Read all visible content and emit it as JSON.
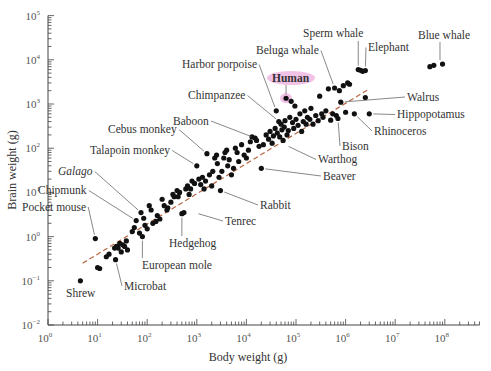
{
  "chart_data": {
    "type": "scatter",
    "title": "",
    "xlabel": "Body weight (g)",
    "ylabel": "Brain weight (g)",
    "xscale": "log",
    "yscale": "log",
    "xlim": [
      1,
      500000000
    ],
    "ylim": [
      0.01,
      100000
    ],
    "x_ticks": [
      {
        "base": "10",
        "exp": "0"
      },
      {
        "base": "10",
        "exp": "1"
      },
      {
        "base": "10",
        "exp": "2"
      },
      {
        "base": "10",
        "exp": "3"
      },
      {
        "base": "10",
        "exp": "4"
      },
      {
        "base": "10",
        "exp": "5"
      },
      {
        "base": "10",
        "exp": "6"
      },
      {
        "base": "10",
        "exp": "7"
      },
      {
        "base": "10",
        "exp": "8"
      }
    ],
    "y_ticks": [
      {
        "base": "10",
        "exp": "−2"
      },
      {
        "base": "10",
        "exp": "−1"
      },
      {
        "base": "10",
        "exp": "0"
      },
      {
        "base": "10",
        "exp": "1"
      },
      {
        "base": "10",
        "exp": "2"
      },
      {
        "base": "10",
        "exp": "3"
      },
      {
        "base": "10",
        "exp": "4"
      },
      {
        "base": "10",
        "exp": "5"
      }
    ],
    "grid": false,
    "legend": null,
    "trendline": {
      "style": "dashed",
      "color": "#b5653f",
      "from": [
        5,
        0.25
      ],
      "to": [
        3000000,
        2200
      ]
    },
    "highlight_color": "#e68fd0",
    "point_color": "#111111",
    "labeled_points": [
      {
        "label": "Shrew",
        "x": 4.5,
        "y": 0.1,
        "lx": 66,
        "ly": 297
      },
      {
        "label": "Microbat",
        "x": 23,
        "y": 0.3,
        "lx": 124,
        "ly": 290
      },
      {
        "label": "Pocket mouse",
        "x": 9,
        "y": 0.9,
        "lx": 22,
        "ly": 211
      },
      {
        "label": "Chipmunk",
        "x": 60,
        "y": 2.3,
        "lx": 38,
        "ly": 194
      },
      {
        "label": "Galago",
        "x": 75,
        "y": 3.5,
        "lx": 58,
        "ly": 175,
        "italic": true
      },
      {
        "label": "European mole",
        "x": 80,
        "y": 1.0,
        "lx": 142,
        "ly": 269
      },
      {
        "label": "Hedgehog",
        "x": 500,
        "y": 3.3,
        "lx": 169,
        "ly": 247
      },
      {
        "label": "Tenrec",
        "x": 900,
        "y": 3.5,
        "lx": 225,
        "ly": 225
      },
      {
        "label": "Rabbit",
        "x": 3000,
        "y": 11,
        "lx": 260,
        "ly": 209
      },
      {
        "label": "Talapoin monkey",
        "x": 1000,
        "y": 40,
        "lx": 90,
        "ly": 154
      },
      {
        "label": "Cebus monkey",
        "x": 1600,
        "y": 75,
        "lx": 108,
        "ly": 133
      },
      {
        "label": "Baboon",
        "x": 15000,
        "y": 170,
        "lx": 173,
        "ly": 125
      },
      {
        "label": "Beaver",
        "x": 20000,
        "y": 35,
        "lx": 323,
        "ly": 180
      },
      {
        "label": "Warthog",
        "x": 60000,
        "y": 120,
        "lx": 318,
        "ly": 163
      },
      {
        "label": "Chimpanzee",
        "x": 46000,
        "y": 400,
        "lx": 188,
        "ly": 99
      },
      {
        "label": "Harbor porpoise",
        "x": 40000,
        "y": 700,
        "lx": 182,
        "ly": 68
      },
      {
        "label": "Human",
        "x": 63000,
        "y": 1350,
        "lx": 272,
        "ly": 82,
        "highlight": true
      },
      {
        "label": "Beluga whale",
        "x": 600000,
        "y": 2300,
        "lx": 256,
        "ly": 54
      },
      {
        "label": "Sperm whale",
        "x": 1800000,
        "y": 6000,
        "lx": 303,
        "ly": 37
      },
      {
        "label": "Elephant",
        "x": 2500000,
        "y": 5700,
        "lx": 368,
        "ly": 51
      },
      {
        "label": "Blue whale",
        "x": 80000000,
        "y": 8000,
        "lx": 418,
        "ly": 39
      },
      {
        "label": "Walrus",
        "x": 800000,
        "y": 1100,
        "lx": 407,
        "ly": 101
      },
      {
        "label": "Hippopotamus",
        "x": 3000000,
        "y": 600,
        "lx": 397,
        "ly": 118
      },
      {
        "label": "Rhinoceros",
        "x": 1500000,
        "y": 600,
        "lx": 374,
        "ly": 135
      },
      {
        "label": "Bison",
        "x": 700000,
        "y": 470,
        "lx": 342,
        "ly": 150
      }
    ],
    "points": [
      [
        4.5,
        0.1
      ],
      [
        9,
        0.9
      ],
      [
        10,
        0.2
      ],
      [
        11,
        0.19
      ],
      [
        15,
        0.35
      ],
      [
        17,
        0.4
      ],
      [
        22,
        0.55
      ],
      [
        23,
        0.3
      ],
      [
        24,
        0.6
      ],
      [
        26,
        0.55
      ],
      [
        28,
        0.7
      ],
      [
        30,
        0.45
      ],
      [
        32,
        0.65
      ],
      [
        35,
        0.6
      ],
      [
        38,
        0.8
      ],
      [
        40,
        0.5
      ],
      [
        50,
        1.3
      ],
      [
        55,
        1.6
      ],
      [
        60,
        2.3
      ],
      [
        70,
        1.2
      ],
      [
        75,
        3.5
      ],
      [
        80,
        1.0
      ],
      [
        85,
        2.6
      ],
      [
        90,
        1.8
      ],
      [
        100,
        1.5
      ],
      [
        110,
        5
      ],
      [
        120,
        4
      ],
      [
        130,
        2
      ],
      [
        150,
        2.2
      ],
      [
        160,
        3
      ],
      [
        180,
        2.5
      ],
      [
        200,
        7
      ],
      [
        220,
        5
      ],
      [
        250,
        4
      ],
      [
        260,
        4.5
      ],
      [
        300,
        6
      ],
      [
        330,
        9
      ],
      [
        350,
        8
      ],
      [
        400,
        11
      ],
      [
        420,
        8
      ],
      [
        450,
        10
      ],
      [
        500,
        3.3
      ],
      [
        550,
        3.5
      ],
      [
        600,
        12
      ],
      [
        650,
        14
      ],
      [
        700,
        9
      ],
      [
        750,
        12
      ],
      [
        800,
        18
      ],
      [
        900,
        16
      ],
      [
        1000,
        40
      ],
      [
        1100,
        20
      ],
      [
        1200,
        15
      ],
      [
        1300,
        22
      ],
      [
        1400,
        12
      ],
      [
        1500,
        18
      ],
      [
        1600,
        75
      ],
      [
        1800,
        25
      ],
      [
        2000,
        14
      ],
      [
        2100,
        30
      ],
      [
        2300,
        60
      ],
      [
        2500,
        70
      ],
      [
        2600,
        45
      ],
      [
        2800,
        22
      ],
      [
        3000,
        11
      ],
      [
        3200,
        30
      ],
      [
        3500,
        60
      ],
      [
        3700,
        80
      ],
      [
        4000,
        90
      ],
      [
        4200,
        40
      ],
      [
        4500,
        55
      ],
      [
        5000,
        25
      ],
      [
        5500,
        35
      ],
      [
        6000,
        100
      ],
      [
        6500,
        80
      ],
      [
        7000,
        50
      ],
      [
        8000,
        120
      ],
      [
        9000,
        70
      ],
      [
        10000,
        60
      ],
      [
        11000,
        90
      ],
      [
        12000,
        140
      ],
      [
        13000,
        180
      ],
      [
        15000,
        170
      ],
      [
        16000,
        150
      ],
      [
        18000,
        110
      ],
      [
        20000,
        35
      ],
      [
        22000,
        120
      ],
      [
        25000,
        200
      ],
      [
        28000,
        160
      ],
      [
        30000,
        240
      ],
      [
        33000,
        130
      ],
      [
        35000,
        190
      ],
      [
        38000,
        280
      ],
      [
        40000,
        700
      ],
      [
        42000,
        220
      ],
      [
        45000,
        400
      ],
      [
        47000,
        180
      ],
      [
        50000,
        350
      ],
      [
        52000,
        260
      ],
      [
        55000,
        150
      ],
      [
        58000,
        300
      ],
      [
        60000,
        420
      ],
      [
        63000,
        1350
      ],
      [
        66000,
        200
      ],
      [
        70000,
        250
      ],
      [
        75000,
        500
      ],
      [
        80000,
        1150
      ],
      [
        85000,
        380
      ],
      [
        90000,
        280
      ],
      [
        95000,
        900
      ],
      [
        100000,
        450
      ],
      [
        110000,
        330
      ],
      [
        120000,
        600
      ],
      [
        130000,
        240
      ],
      [
        140000,
        400
      ],
      [
        150000,
        700
      ],
      [
        160000,
        350
      ],
      [
        170000,
        500
      ],
      [
        190000,
        450
      ],
      [
        200000,
        800
      ],
      [
        220000,
        350
      ],
      [
        250000,
        550
      ],
      [
        280000,
        420
      ],
      [
        300000,
        1500
      ],
      [
        330000,
        600
      ],
      [
        350000,
        500
      ],
      [
        400000,
        700
      ],
      [
        450000,
        2200
      ],
      [
        500000,
        430
      ],
      [
        550000,
        600
      ],
      [
        600000,
        2300
      ],
      [
        650000,
        550
      ],
      [
        700000,
        470
      ],
      [
        750000,
        2000
      ],
      [
        800000,
        1100
      ],
      [
        900000,
        2600
      ],
      [
        1000000,
        650
      ],
      [
        1100000,
        3000
      ],
      [
        1200000,
        2800
      ],
      [
        1500000,
        600
      ],
      [
        1800000,
        6000
      ],
      [
        2000000,
        5800
      ],
      [
        2200000,
        5500
      ],
      [
        2500000,
        5700
      ],
      [
        2500000,
        1400
      ],
      [
        3000000,
        600
      ],
      [
        50000000,
        7000
      ],
      [
        60000000,
        7500
      ],
      [
        90000000,
        8000
      ]
    ]
  }
}
